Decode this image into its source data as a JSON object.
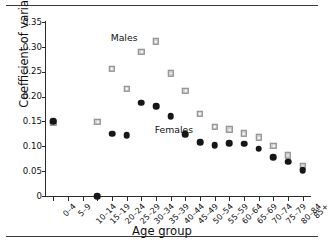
{
  "figure": {
    "top_rule": true,
    "bottom_rule": true
  },
  "chart_data": {
    "type": "scatter",
    "title": "",
    "xlabel": "Age group",
    "ylabel": "Coefficient of variation",
    "categories": [
      "0–4",
      "5–9",
      "10–14",
      "15–19",
      "20–24",
      "25–29",
      "30–34",
      "35–39",
      "40–44",
      "45–49",
      "50–54",
      "55–59",
      "60–64",
      "65–69",
      "70–74",
      "75–79",
      "80–84",
      "85+"
    ],
    "yticks": [
      0,
      0.05,
      0.1,
      0.15,
      0.2,
      0.25,
      0.3,
      0.35
    ],
    "ytick_labels": [
      "0",
      "0.05",
      "0.10",
      "0.15",
      "0.20",
      "0.25",
      "0.30",
      "0.35"
    ],
    "ylim": [
      0,
      0.35
    ],
    "grid": false,
    "legend_position": "inline-annotations",
    "series": [
      {
        "name": "Males",
        "marker": "square",
        "color": "#c9c9c9",
        "edge_color": "#8e8e8e",
        "values": [
          0.147,
          null,
          null,
          0.149,
          0.256,
          0.216,
          0.29,
          0.311,
          0.247,
          0.212,
          0.165,
          0.139,
          0.134,
          0.126,
          0.118,
          0.101,
          0.082,
          0.06
        ]
      },
      {
        "name": "Females",
        "marker": "circle",
        "color": "#161616",
        "values": [
          0.15,
          null,
          null,
          0.0,
          0.125,
          0.122,
          0.188,
          0.181,
          0.16,
          0.124,
          0.108,
          0.102,
          0.106,
          0.105,
          0.095,
          0.078,
          0.069,
          0.052
        ]
      }
    ],
    "annotations": [
      {
        "text": "Males",
        "x_category": "25–29",
        "y": 0.318
      },
      {
        "text": "Females",
        "x_category": "40–44",
        "y": 0.133
      }
    ]
  }
}
